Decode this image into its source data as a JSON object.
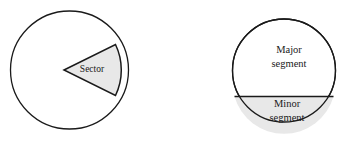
{
  "figure": {
    "background_color": "#FFFFFF",
    "stroke_color": "#1A1A1A",
    "shade_color": "#E8E8E8",
    "text_color": "#1A1A1A"
  },
  "left_diagram": {
    "name": "sector-circle",
    "circle": {
      "cx": 69.5,
      "cy": 70,
      "r": 59
    },
    "sector": {
      "apex_x": 64,
      "apex_y": 70,
      "start_x": 115.5,
      "start_y": 44.5,
      "end_x": 115.5,
      "end_y": 95.5,
      "fill": "#E8E8E8"
    },
    "label": "Sector",
    "label_x": 92,
    "label_y": 70
  },
  "right_diagram": {
    "name": "segment-circle",
    "circle": {
      "cx": 284,
      "cy": 70.5,
      "r": 51.5
    },
    "chord": {
      "x1": 234.5,
      "y1": 96.5,
      "x2": 333.5,
      "y2": 96.5
    },
    "major_segment": {
      "label_line1": "Major",
      "label_line2": "segment",
      "label_x": 289,
      "label_y1": 51,
      "label_y2": 65,
      "fill": "#FFFFFF"
    },
    "minor_segment": {
      "label_line1": "Minor",
      "label_line2": "segment",
      "label_x": 287,
      "label_y1": 105,
      "label_y2": 119,
      "fill": "#E8E8E8"
    }
  },
  "chart_data": {
    "type": "diagram",
    "shapes": [
      {
        "id": "sector-circle",
        "kind": "circle-with-sector",
        "center": [
          69.5,
          70
        ],
        "radius": 59,
        "sector_angle_deg": 52,
        "sector_bisector_deg": 0,
        "annotations": [
          "Sector"
        ]
      },
      {
        "id": "segment-circle",
        "kind": "circle-with-chord",
        "center": [
          284,
          70.5
        ],
        "radius": 51.5,
        "chord_offset_below_center": 26,
        "annotations": [
          "Major segment",
          "Minor segment"
        ]
      }
    ]
  }
}
